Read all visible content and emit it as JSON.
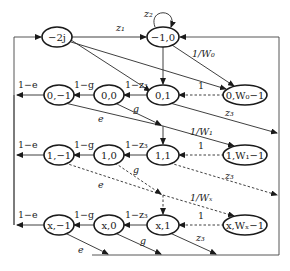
{
  "diagram": {
    "type": "markov-chain-state-transition",
    "nodes": {
      "idle": "−2j",
      "start": "−1,0",
      "r0": [
        "0,−1",
        "0,0",
        "0,1",
        "0,W₀−1"
      ],
      "r1": [
        "1,−1",
        "1,0",
        "1,1",
        "1,W₁−1"
      ],
      "rx": [
        "x,−1",
        "x,0",
        "x,1",
        "x,Wₓ−1"
      ]
    },
    "labels": {
      "z1": "z₁",
      "z2": "z₂",
      "z3": "z₃",
      "inv_w0": "1/W₀",
      "inv_w1": "1/W₁",
      "inv_wx": "1/Wₓ",
      "one": "1",
      "one_minus_e": "1−e",
      "one_minus_g": "1−g",
      "one_minus_z3": "1−z₃",
      "e": "e",
      "g": "g"
    },
    "colors": {
      "stroke": "#1a1a1a",
      "background": "#ffffff"
    }
  }
}
